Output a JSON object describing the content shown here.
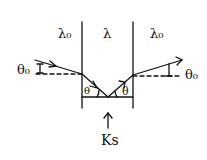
{
  "diagram": {
    "regions": [
      {
        "label": "λ₀",
        "position": "left"
      },
      {
        "label": "λ",
        "position": "center"
      },
      {
        "label": "λ₀",
        "position": "right"
      }
    ],
    "angles": {
      "incident": "θ₀",
      "inner_left": "θ",
      "inner_right": "θ",
      "exit": "θ₀"
    },
    "bottom_label": "Ks",
    "stroke_color": "#111111"
  }
}
